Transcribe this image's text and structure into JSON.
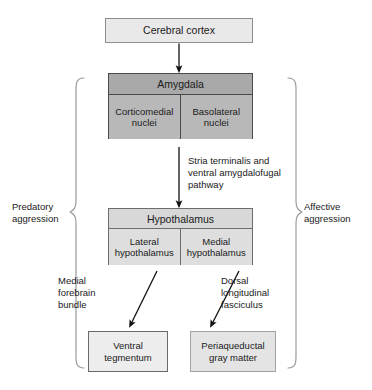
{
  "diagram": {
    "nodes": {
      "cortex": {
        "label": "Cerebral cortex"
      },
      "amygdala": {
        "header": "Amygdala",
        "left_nucleus": "Corticomedial nuclei",
        "right_nucleus": "Basolateral nuclei"
      },
      "hypothalamus": {
        "header": "Hypothalamus",
        "left_division": "Lateral hypothalamus",
        "right_division": "Medial hypothalamus"
      },
      "ventral_tegmentum": {
        "label": "Ventral tegmentum"
      },
      "periaqueductal": {
        "label": "Periaqueductal gray matter"
      }
    },
    "pathway_labels": {
      "stria": "Stria terminalis and ventral amygdalofugal pathway",
      "medial_forebrain_bundle": "Medial forebrain bundle",
      "dorsal_longitudinal_fasciculus": "Dorsal longitudinal fasciculus"
    },
    "brackets": {
      "left": "Predatory aggression",
      "right": "Affective aggression"
    },
    "colors": {
      "cortex_fill": "#e9e9e9",
      "amygdala_header_fill": "#a9a9a9",
      "amygdala_sub_fill": "#b8b8b8",
      "hypothalamus_header_fill": "#d8d8d8",
      "hypothalamus_sub_fill": "#dedede",
      "ventral_tegmentum_fill": "#ededed",
      "periaqueductal_fill": "#e4e4e4",
      "stroke": "#4a4a4a",
      "bracket_stroke": "#9a9a9a",
      "text": "#1a1a1a",
      "background": "#ffffff"
    }
  }
}
